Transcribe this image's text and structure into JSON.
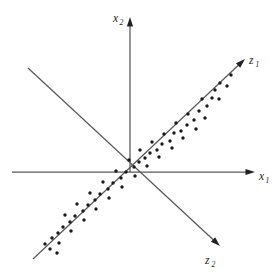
{
  "figure": {
    "background_color": "#ffffff",
    "axis_color": "#595959",
    "point_color": "#1a1a1a",
    "width": 277,
    "height": 273
  },
  "labels": {
    "x1": {
      "base": "x",
      "sub": "1"
    },
    "x2": {
      "base": "x",
      "sub": "2"
    },
    "z1": {
      "base": "z",
      "sub": "1"
    },
    "z2": {
      "base": "z",
      "sub": "2"
    }
  },
  "chart_data": {
    "type": "scatter",
    "title": "",
    "xlabel": "x₁",
    "ylabel": "x₂",
    "grid": false,
    "legend": null,
    "axis_origin": {
      "x": 130,
      "y": 172
    },
    "axes": [
      {
        "name": "x1",
        "label": "x₁",
        "kind": "original",
        "arrow": "end",
        "from": {
          "x": 12,
          "y": 172
        },
        "to": {
          "x": 255,
          "y": 172
        },
        "label_pos": {
          "x": 259,
          "y": 180
        }
      },
      {
        "name": "x2",
        "label": "x₂",
        "kind": "original",
        "arrow": "end",
        "from": {
          "x": 130,
          "y": 172
        },
        "to": {
          "x": 130,
          "y": 17
        },
        "label_pos": {
          "x": 113,
          "y": 22
        }
      },
      {
        "name": "z1",
        "label": "z₁",
        "kind": "principal",
        "arrow": "end",
        "from": {
          "x": 33,
          "y": 259
        },
        "to": {
          "x": 245,
          "y": 59
        },
        "label_pos": {
          "x": 249,
          "y": 64
        }
      },
      {
        "name": "z2",
        "label": "z₂",
        "kind": "principal",
        "arrow": "end",
        "from": {
          "x": 28,
          "y": 68
        },
        "to": {
          "x": 220,
          "y": 246
        },
        "label_pos": {
          "x": 205,
          "y": 264
        }
      }
    ],
    "point_radius": 1.7,
    "points": [
      {
        "x": 231,
        "y": 75
      },
      {
        "x": 227,
        "y": 86
      },
      {
        "x": 220,
        "y": 83
      },
      {
        "x": 215,
        "y": 90
      },
      {
        "x": 212,
        "y": 98
      },
      {
        "x": 219,
        "y": 99
      },
      {
        "x": 207,
        "y": 106
      },
      {
        "x": 202,
        "y": 99
      },
      {
        "x": 199,
        "y": 111
      },
      {
        "x": 205,
        "y": 118
      },
      {
        "x": 194,
        "y": 120
      },
      {
        "x": 188,
        "y": 114
      },
      {
        "x": 187,
        "y": 125
      },
      {
        "x": 196,
        "y": 129
      },
      {
        "x": 181,
        "y": 131
      },
      {
        "x": 176,
        "y": 123
      },
      {
        "x": 174,
        "y": 133
      },
      {
        "x": 183,
        "y": 138
      },
      {
        "x": 170,
        "y": 141
      },
      {
        "x": 164,
        "y": 134
      },
      {
        "x": 162,
        "y": 144
      },
      {
        "x": 172,
        "y": 148
      },
      {
        "x": 157,
        "y": 150
      },
      {
        "x": 152,
        "y": 142
      },
      {
        "x": 150,
        "y": 153
      },
      {
        "x": 159,
        "y": 157
      },
      {
        "x": 145,
        "y": 158
      },
      {
        "x": 140,
        "y": 150
      },
      {
        "x": 139,
        "y": 162
      },
      {
        "x": 147,
        "y": 166
      },
      {
        "x": 134,
        "y": 167
      },
      {
        "x": 129,
        "y": 160
      },
      {
        "x": 126,
        "y": 172
      },
      {
        "x": 135,
        "y": 176
      },
      {
        "x": 121,
        "y": 178
      },
      {
        "x": 116,
        "y": 171
      },
      {
        "x": 113,
        "y": 183
      },
      {
        "x": 122,
        "y": 187
      },
      {
        "x": 108,
        "y": 189
      },
      {
        "x": 103,
        "y": 182
      },
      {
        "x": 100,
        "y": 194
      },
      {
        "x": 109,
        "y": 198
      },
      {
        "x": 95,
        "y": 200
      },
      {
        "x": 90,
        "y": 193
      },
      {
        "x": 88,
        "y": 205
      },
      {
        "x": 96,
        "y": 209
      },
      {
        "x": 83,
        "y": 211
      },
      {
        "x": 77,
        "y": 204
      },
      {
        "x": 75,
        "y": 216
      },
      {
        "x": 84,
        "y": 220
      },
      {
        "x": 70,
        "y": 222
      },
      {
        "x": 65,
        "y": 215
      },
      {
        "x": 63,
        "y": 227
      },
      {
        "x": 71,
        "y": 231
      },
      {
        "x": 58,
        "y": 233
      },
      {
        "x": 52,
        "y": 238
      },
      {
        "x": 59,
        "y": 243
      },
      {
        "x": 50,
        "y": 249
      },
      {
        "x": 45,
        "y": 244
      },
      {
        "x": 57,
        "y": 253
      }
    ]
  }
}
